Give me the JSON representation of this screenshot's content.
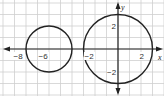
{
  "chart_data": {
    "type": "diagram-graph",
    "title": "",
    "xlabel": "x",
    "ylabel": "y",
    "grid": true,
    "xlim": [
      -10.3,
      3.9
    ],
    "ylim": [
      -4.2,
      4.2
    ],
    "x_ticks_labeled": [
      -8,
      -6,
      -2,
      2
    ],
    "y_ticks_labeled": [
      2,
      -2
    ],
    "circles": [
      {
        "name": "left circle",
        "center": [
          -6,
          0
        ],
        "radius": 2
      },
      {
        "name": "right circle",
        "center": [
          0,
          0
        ],
        "radius": 3
      }
    ],
    "colors": {
      "grid": "#c8c8c8",
      "axis": "#222222",
      "circle": "#222222",
      "background": "#ffffff"
    }
  },
  "labels": {
    "x_axis": "x",
    "y_axis": "y",
    "tick_neg8": "−8",
    "tick_neg6": "−6",
    "tick_neg2": "−2",
    "tick_2": "2",
    "ytick_2": "2",
    "ytick_neg2": "−2"
  }
}
